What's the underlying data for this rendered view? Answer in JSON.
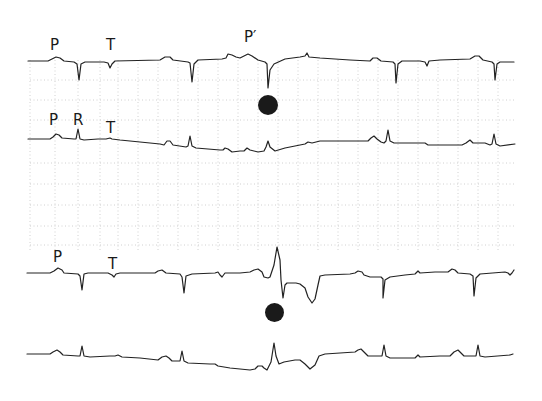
{
  "figure": {
    "type": "ECG rhythm strip",
    "ink_color": "#222222",
    "grid_color": "#bdbdbd",
    "background": "#ffffff"
  },
  "strips": [
    {
      "id": "strip-1",
      "labels": [
        {
          "text": "P",
          "x": 50,
          "y": 38
        },
        {
          "text": "T",
          "x": 106,
          "y": 38
        },
        {
          "text": "P′",
          "x": 244,
          "y": 30
        }
      ]
    },
    {
      "id": "strip-2",
      "labels": [
        {
          "text": "P",
          "x": 49,
          "y": 113
        },
        {
          "text": "R",
          "x": 73,
          "y": 113
        },
        {
          "text": "T",
          "x": 106,
          "y": 121
        }
      ]
    },
    {
      "id": "strip-3",
      "labels": [
        {
          "text": "P",
          "x": 53,
          "y": 250
        },
        {
          "text": "T",
          "x": 108,
          "y": 257
        }
      ]
    },
    {
      "id": "strip-4",
      "labels": []
    }
  ],
  "markers": [
    {
      "name": "premature-beat-marker-top",
      "x": 258,
      "y": 95,
      "size": 20
    },
    {
      "name": "premature-beat-marker-bottom",
      "x": 265,
      "y": 303,
      "size": 19
    }
  ]
}
